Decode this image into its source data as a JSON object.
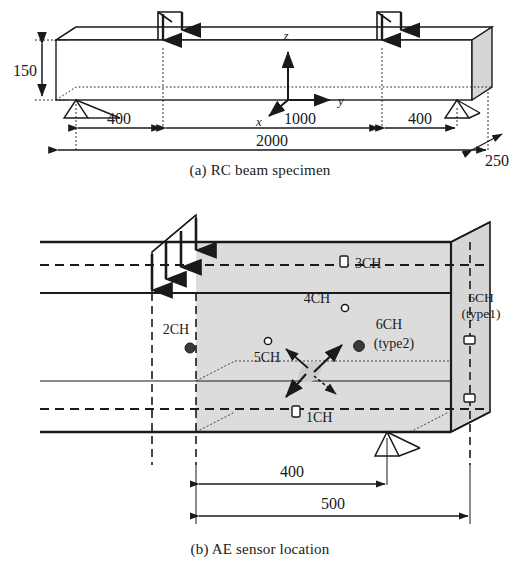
{
  "figure": {
    "panels": [
      {
        "id": "a",
        "caption": "(a) RC beam specimen",
        "title": "RC beam specimen"
      },
      {
        "id": "b",
        "caption": "(b) AE sensor location",
        "title": "AE sensor location"
      }
    ]
  },
  "panel_a": {
    "caption": "(a) RC beam specimen",
    "dimensions": {
      "height": "150",
      "span_left": "400",
      "span_middle": "1000",
      "span_right": "400",
      "total_length": "2000",
      "width_depth": "250"
    },
    "axes": {
      "z": "z",
      "y": "y",
      "x": "x"
    },
    "loads": [
      {
        "name": "load-left",
        "label": ""
      },
      {
        "name": "load-right",
        "label": ""
      }
    ],
    "supports": [
      {
        "name": "support-left"
      },
      {
        "name": "support-right"
      }
    ]
  },
  "panel_b": {
    "caption": "(b) AE sensor location",
    "dimensions": {
      "sensor_zone": "400",
      "end_zone": "500"
    },
    "sensors": [
      {
        "id": "1CH",
        "label": "1CH",
        "sublabel": "",
        "marker": "cylinder-icon"
      },
      {
        "id": "2CH",
        "label": "2CH",
        "sublabel": "",
        "marker": "filled-circle"
      },
      {
        "id": "3CH",
        "label": "3CH",
        "sublabel": "",
        "marker": "cylinder-icon"
      },
      {
        "id": "4CH",
        "label": "4CH",
        "sublabel": "",
        "marker": "open-circle"
      },
      {
        "id": "5CH",
        "label": "5CH",
        "sublabel": "",
        "marker": "open-circle"
      },
      {
        "id": "6CH2",
        "label": "6CH",
        "sublabel": "(type2)",
        "marker": "filled-circle"
      },
      {
        "id": "6CH1",
        "label": "6CH",
        "sublabel": "(type1)",
        "marker": "rect-icon"
      }
    ],
    "ae_source": {
      "name": "ae-crack-source",
      "arrow_count": 4
    }
  },
  "colors": {
    "line": "#1a1a1a",
    "face_shade": "#d6d6d6",
    "body_shade": "#dcdcdc",
    "marker_fill": "#3a3a3a",
    "background": "#ffffff"
  }
}
